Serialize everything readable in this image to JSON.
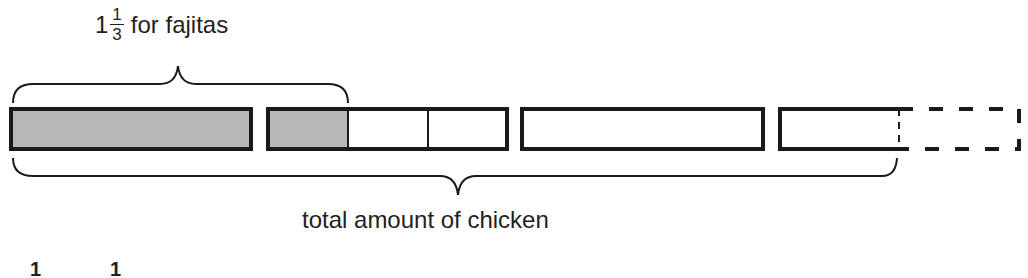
{
  "diagram": {
    "type": "tape-diagram",
    "top_label": {
      "whole": "1",
      "numerator": "1",
      "denominator": "3",
      "text": "for fajitas"
    },
    "bottom_label": "total amount of chicken",
    "colors": {
      "shaded": "#b8b8b8",
      "stroke": "#1a1a1a",
      "background": "#ffffff"
    },
    "bars": [
      {
        "id": "bar-1",
        "parts": 1,
        "shaded_parts": 1,
        "style": "solid"
      },
      {
        "id": "bar-2",
        "parts": 3,
        "shaded_parts": 1,
        "style": "solid"
      },
      {
        "id": "bar-3",
        "parts": 1,
        "shaded_parts": 0,
        "style": "solid"
      },
      {
        "id": "bar-4",
        "parts": 1,
        "shaded_parts": 0,
        "style": "half-solid-half-dashed"
      }
    ],
    "cut_off_bottom_text": [
      "1",
      "1"
    ]
  }
}
